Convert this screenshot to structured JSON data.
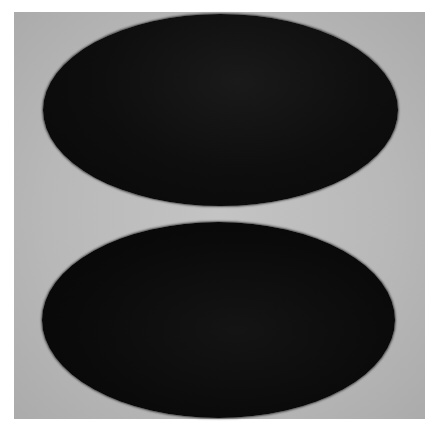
{
  "image": {
    "description": "Two dark ellipses stacked vertically on a light gray background",
    "colors": {
      "background": "#ffffff",
      "panel": "#bcbcbc",
      "ellipse": "#0b0b0b"
    },
    "shapes": [
      {
        "name": "top-ellipse",
        "cx": 220,
        "cy": 110,
        "rx": 177,
        "ry": 96
      },
      {
        "name": "bottom-ellipse",
        "cx": 218,
        "cy": 320,
        "rx": 176,
        "ry": 98
      }
    ]
  }
}
